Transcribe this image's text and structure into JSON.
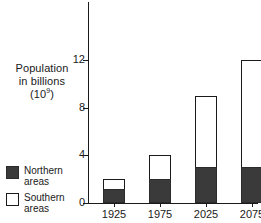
{
  "chart_data": {
    "type": "bar",
    "stacked": true,
    "title": "",
    "subtitle": "",
    "xlabel": "",
    "ylabel": "Population in billions (10⁹)",
    "ylabel_lines": [
      "Population",
      "in billions",
      "(10⁹)"
    ],
    "categories": [
      "1925",
      "1975",
      "2025",
      "2075"
    ],
    "series": [
      {
        "name": "Northern areas",
        "values": [
          1.2,
          2,
          3,
          3
        ],
        "color": "#3a3a3a"
      },
      {
        "name": "Southern areas",
        "values": [
          0.8,
          2,
          6,
          9
        ],
        "color": "#ffffff"
      }
    ],
    "totals": [
      2,
      4,
      9,
      12
    ],
    "ylim": [
      0,
      12
    ],
    "yticks": [
      0,
      4,
      8,
      12
    ],
    "ytick_labels": [
      "0",
      "4",
      "8",
      "12"
    ],
    "grid": false,
    "legend_position": "bottom-left",
    "legend": [
      {
        "label_lines": [
          "Northern",
          "areas"
        ],
        "swatch": "filled-dark"
      },
      {
        "label_lines": [
          "Southern",
          "areas"
        ],
        "swatch": "outlined-white"
      }
    ],
    "colors": {
      "northern": "#3a3a3a",
      "southern": "#ffffff",
      "axis": "#1a1a1a",
      "background": "#ffffff"
    }
  }
}
